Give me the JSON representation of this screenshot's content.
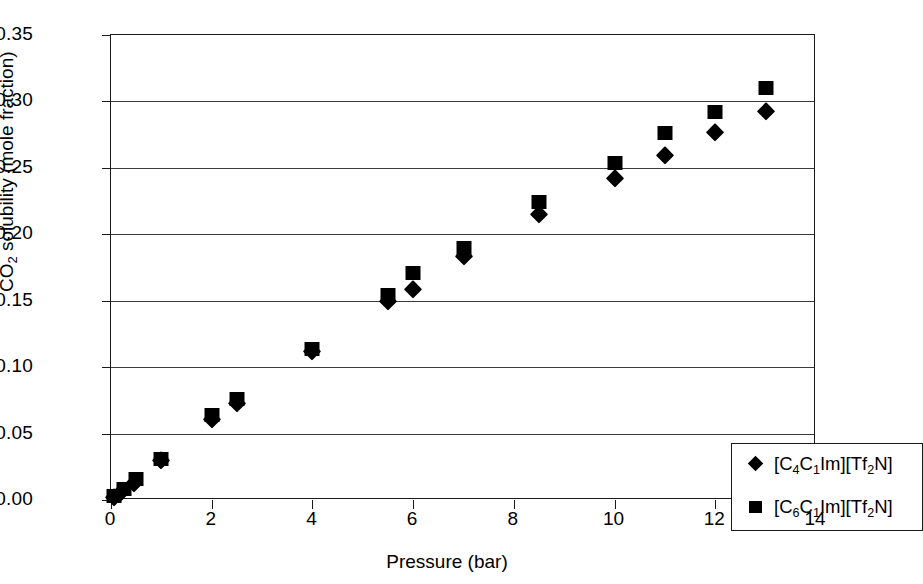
{
  "chart_data": {
    "type": "scatter",
    "title": "",
    "xlabel": "Pressure (bar)",
    "ylabel": "CO2 solubility (mole fraction)",
    "ylabel_parts": {
      "pre": "CO",
      "sub": "2",
      "post": " solubility (mole fraction)"
    },
    "xlim": [
      0,
      14
    ],
    "ylim": [
      0.0,
      0.35
    ],
    "xticks": [
      0,
      2,
      4,
      6,
      8,
      10,
      12,
      14
    ],
    "xtick_labels": [
      "0",
      "2",
      "4",
      "6",
      "8",
      "10",
      "12",
      "14"
    ],
    "yticks": [
      0.0,
      0.05,
      0.1,
      0.15,
      0.2,
      0.25,
      0.3,
      0.35
    ],
    "ytick_labels": [
      "0.00",
      "0.05",
      "0.10",
      "0.15",
      "0.20",
      "0.25",
      "0.30",
      "0.35"
    ],
    "grid": "horizontal",
    "legend_position": "lower-right",
    "marker_color": "#000000",
    "series": [
      {
        "name": "[C4C1Im][Tf2N]",
        "name_parts": [
          "[C",
          "4",
          "C",
          "1",
          "Im][Tf",
          "2",
          "N]"
        ],
        "marker": "diamond",
        "points": [
          {
            "x": 0.05,
            "y": 0.002
          },
          {
            "x": 0.2,
            "y": 0.006
          },
          {
            "x": 0.45,
            "y": 0.013
          },
          {
            "x": 1.0,
            "y": 0.03
          },
          {
            "x": 2.0,
            "y": 0.061
          },
          {
            "x": 2.5,
            "y": 0.073
          },
          {
            "x": 4.0,
            "y": 0.112
          },
          {
            "x": 5.5,
            "y": 0.15
          },
          {
            "x": 6.0,
            "y": 0.159
          },
          {
            "x": 7.0,
            "y": 0.184
          },
          {
            "x": 8.5,
            "y": 0.215
          },
          {
            "x": 10.0,
            "y": 0.242
          },
          {
            "x": 11.0,
            "y": 0.26
          },
          {
            "x": 12.0,
            "y": 0.277
          },
          {
            "x": 13.0,
            "y": 0.293
          }
        ]
      },
      {
        "name": "[C6C1Im][Tf2N]",
        "name_parts": [
          "[C",
          "6",
          "C",
          "1",
          "Im][Tf",
          "2",
          "N]"
        ],
        "marker": "square",
        "points": [
          {
            "x": 0.05,
            "y": 0.003
          },
          {
            "x": 0.25,
            "y": 0.008
          },
          {
            "x": 0.5,
            "y": 0.016
          },
          {
            "x": 1.0,
            "y": 0.031
          },
          {
            "x": 2.0,
            "y": 0.064
          },
          {
            "x": 2.5,
            "y": 0.076
          },
          {
            "x": 4.0,
            "y": 0.114
          },
          {
            "x": 5.5,
            "y": 0.154
          },
          {
            "x": 6.0,
            "y": 0.171
          },
          {
            "x": 7.0,
            "y": 0.19
          },
          {
            "x": 8.5,
            "y": 0.224
          },
          {
            "x": 10.0,
            "y": 0.254
          },
          {
            "x": 11.0,
            "y": 0.276
          },
          {
            "x": 12.0,
            "y": 0.292
          },
          {
            "x": 13.0,
            "y": 0.31
          }
        ]
      }
    ]
  }
}
